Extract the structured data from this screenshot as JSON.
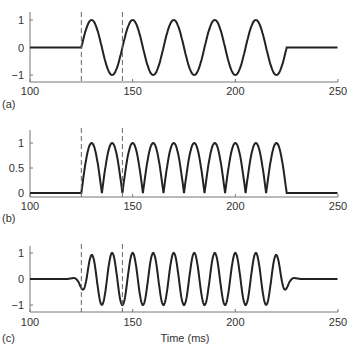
{
  "chart_data": [
    {
      "type": "line",
      "panel_label": "(a)",
      "title": "",
      "xlabel": "",
      "ylabel": "",
      "xlim": [
        100,
        250
      ],
      "ylim": [
        -1.25,
        1.25
      ],
      "xticks": [
        100,
        150,
        200,
        250
      ],
      "xtick_labels": [
        "100",
        "150",
        "200",
        "250"
      ],
      "yticks": [
        -1,
        0,
        1
      ],
      "ytick_labels": [
        "−1",
        "0",
        "1"
      ],
      "markers_x": [
        125,
        145
      ],
      "series": [
        {
          "name": "signal",
          "description": "sinusoid, period 20 ms, starts at 125 ms, ends at 225 ms, zero elsewhere",
          "onset": 125,
          "offset": 225,
          "period": 20,
          "amplitude": 1,
          "kind": "sine"
        }
      ],
      "grid": false
    },
    {
      "type": "line",
      "panel_label": "(b)",
      "title": "",
      "xlabel": "",
      "ylabel": "",
      "xlim": [
        100,
        250
      ],
      "ylim": [
        -0.05,
        1.25
      ],
      "xticks": [
        100,
        150,
        200,
        250
      ],
      "xtick_labels": [
        "100",
        "150",
        "200",
        "250"
      ],
      "yticks": [
        0,
        0.5,
        1
      ],
      "ytick_labels": [
        "0",
        "0.5",
        "1"
      ],
      "markers_x": [
        125,
        145
      ],
      "series": [
        {
          "name": "rectified",
          "description": "full-wave rectified sinusoid |sin|, 10 lobes between 125 and 225 ms",
          "onset": 125,
          "offset": 225,
          "period": 20,
          "amplitude": 1,
          "kind": "abs_sine"
        }
      ],
      "grid": false
    },
    {
      "type": "line",
      "panel_label": "(c)",
      "title": "",
      "xlabel": "Time (ms)",
      "ylabel": "",
      "xlim": [
        100,
        250
      ],
      "ylim": [
        -1.25,
        1.25
      ],
      "xticks": [
        100,
        150,
        200,
        250
      ],
      "xtick_labels": [
        "100",
        "150",
        "200",
        "250"
      ],
      "yticks": [
        -1,
        0,
        1
      ],
      "ytick_labels": [
        "−1",
        "0",
        "1"
      ],
      "markers_x": [
        125,
        145
      ],
      "series": [
        {
          "name": "filtered",
          "description": "band-pass filtered oscillation, period 10 ms, with pre/post ringing around 115–125 and 225–235 ms",
          "onset": 125,
          "offset": 225,
          "period": 10,
          "amplitude": 1,
          "kind": "filtered_sine"
        }
      ],
      "grid": false
    }
  ],
  "labels": {
    "panel_a": "(a)",
    "panel_b": "(b)",
    "panel_c": "(c)",
    "x_axis_title": "Time (ms)"
  }
}
